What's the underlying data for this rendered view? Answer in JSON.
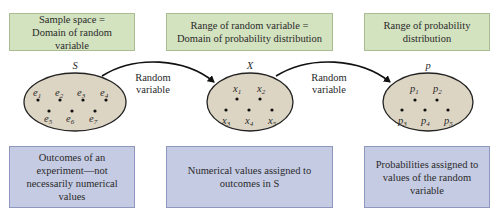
{
  "top_boxes": [
    {
      "text": "Sample space =\nDomain of random variable"
    },
    {
      "text": "Range of random variable =\nDomain of probability distribution"
    },
    {
      "text": "Range of probability\ndistribution"
    }
  ],
  "bottom_boxes": [
    {
      "text": "Outcomes of an\nexperiment—not\nnecessarily numerical\nvalues"
    },
    {
      "text": "Numerical values assigned to\noutcomes in S"
    },
    {
      "text": "Probabilities assigned to\nvalues of the random\nvariable"
    }
  ],
  "sets": [
    {
      "name": "S",
      "elements": [
        "e1",
        "e2",
        "e3",
        "e4",
        "e5",
        "e6",
        "e7"
      ]
    },
    {
      "name": "X",
      "elements": [
        "x1",
        "x2",
        "x3",
        "x4",
        "x5"
      ]
    },
    {
      "name": "p",
      "elements": [
        "p1",
        "p2",
        "p3",
        "p4",
        "p5"
      ]
    }
  ],
  "arrows": [
    {
      "label_line1": "Random",
      "label_line2": "variable"
    },
    {
      "label_line1": "Random",
      "label_line2": "variable"
    }
  ],
  "colors": {
    "top_box_fill": "#d3e2bf",
    "bottom_box_fill": "#c5cbe3",
    "ellipse_fill": "#ddd5c4"
  }
}
